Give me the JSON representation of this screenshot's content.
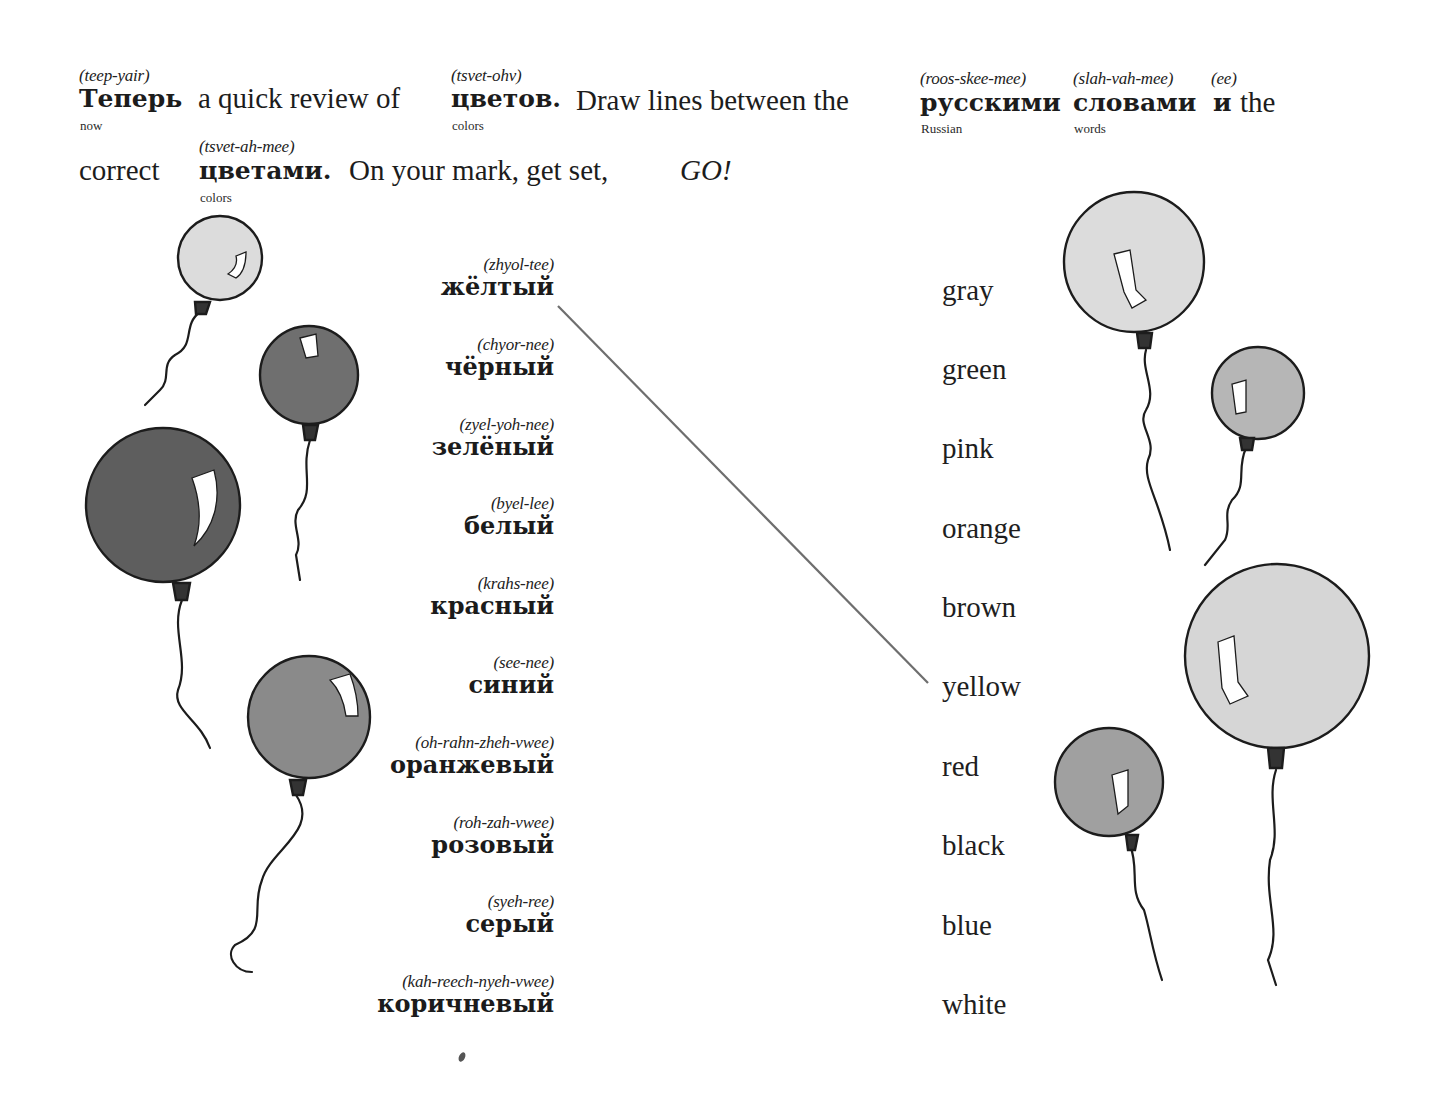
{
  "instructions": {
    "line1": [
      {
        "word": "Теперь",
        "pron": "(teep-yair)",
        "gloss": "now",
        "bold": true
      },
      {
        "word": "a quick review of",
        "bold": false
      },
      {
        "word": "цветов.",
        "pron": "(tsvet-ohv)",
        "gloss": "colors",
        "bold": true
      },
      {
        "word": "Draw lines between the",
        "bold": false
      },
      {
        "word": "русскими",
        "pron": "(roos-skee-mee)",
        "gloss": "Russian",
        "bold": true
      },
      {
        "word": "словами",
        "pron": "(slah-vah-mee)",
        "gloss": "words",
        "bold": true
      },
      {
        "word": "и",
        "pron": "(ee)",
        "bold": true
      },
      {
        "word": "the",
        "bold": false
      }
    ],
    "line2": [
      {
        "word": "correct",
        "bold": false
      },
      {
        "word": "цветами.",
        "pron": "(tsvet-ah-mee)",
        "gloss": "colors",
        "bold": true
      },
      {
        "word": "On your mark, get set,",
        "bold": false
      },
      {
        "word": "GO!",
        "italic": true
      }
    ]
  },
  "russian_words": [
    {
      "pron": "(zhyol-tee)",
      "word": "жёлтый"
    },
    {
      "pron": "(chyor-nee)",
      "word": "чёрный"
    },
    {
      "pron": "(zyel-yoh-nee)",
      "word": "зелёный"
    },
    {
      "pron": "(byel-lee)",
      "word": "белый"
    },
    {
      "pron": "(krahs-nee)",
      "word": "красный"
    },
    {
      "pron": "(see-nee)",
      "word": "синий"
    },
    {
      "pron": "(oh-rahn-zheh-vwee)",
      "word": "оранжевый"
    },
    {
      "pron": "(roh-zah-vwee)",
      "word": "розовый"
    },
    {
      "pron": "(syeh-ree)",
      "word": "серый"
    },
    {
      "pron": "(kah-reech-nyeh-vwee)",
      "word": "коричневый"
    }
  ],
  "english_words": [
    "gray",
    "green",
    "pink",
    "orange",
    "brown",
    "yellow",
    "red",
    "black",
    "blue",
    "white"
  ],
  "example_match": {
    "from": "жёлтый",
    "to": "yellow"
  },
  "colors": {
    "ink": "#1c1c1c",
    "line": "#6e6e6e",
    "balloon_light": "#d9d9d9",
    "balloon_mid": "#a8a8a8",
    "balloon_dark": "#6f6f6f",
    "balloon_xdark": "#5e5e5e"
  }
}
